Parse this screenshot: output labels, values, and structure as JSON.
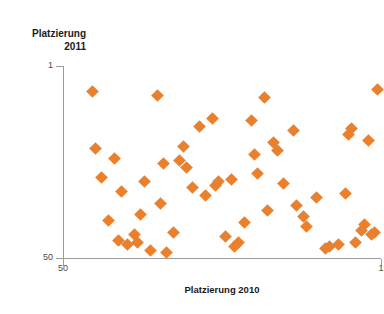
{
  "chart_data": {
    "type": "scatter",
    "title": "",
    "xlabel": "Platzierung 2010",
    "ylabel": "Platzierung 2011",
    "ylabel_lines": [
      "Platzierung",
      "2011"
    ],
    "xlim": [
      50,
      1
    ],
    "ylim": [
      1,
      50
    ],
    "x_reversed": true,
    "y_reversed": true,
    "grid": false,
    "legend": null,
    "marker": "diamond",
    "marker_color": "#E8802E",
    "xticks": [
      50,
      1
    ],
    "xtick_labels": [
      "50",
      "1"
    ],
    "yticks": [
      1,
      50
    ],
    "ytick_labels": [
      "1",
      "50"
    ],
    "series": [
      {
        "name": "Platzierung 2010 vs 2011",
        "color": "#E8802E",
        "points": [
          {
            "x": 45.5,
            "y": 7.5
          },
          {
            "x": 45.0,
            "y": 22.0
          },
          {
            "x": 44.0,
            "y": 29.5
          },
          {
            "x": 43.0,
            "y": 40.5
          },
          {
            "x": 42.0,
            "y": 24.5
          },
          {
            "x": 41.5,
            "y": 45.5
          },
          {
            "x": 41.0,
            "y": 33.0
          },
          {
            "x": 40.0,
            "y": 46.5
          },
          {
            "x": 39.0,
            "y": 44.0
          },
          {
            "x": 38.5,
            "y": 46.0
          },
          {
            "x": 38.0,
            "y": 39.0
          },
          {
            "x": 37.5,
            "y": 30.5
          },
          {
            "x": 36.5,
            "y": 48.0
          },
          {
            "x": 35.5,
            "y": 8.5
          },
          {
            "x": 35.0,
            "y": 36.0
          },
          {
            "x": 34.5,
            "y": 26.0
          },
          {
            "x": 34.0,
            "y": 48.5
          },
          {
            "x": 33.0,
            "y": 43.5
          },
          {
            "x": 32.0,
            "y": 25.0
          },
          {
            "x": 31.5,
            "y": 21.5
          },
          {
            "x": 31.0,
            "y": 27.0
          },
          {
            "x": 30.0,
            "y": 32.0
          },
          {
            "x": 29.0,
            "y": 16.5
          },
          {
            "x": 28.0,
            "y": 34.0
          },
          {
            "x": 27.0,
            "y": 14.5
          },
          {
            "x": 26.5,
            "y": 31.5
          },
          {
            "x": 26.0,
            "y": 30.5
          },
          {
            "x": 25.0,
            "y": 44.5
          },
          {
            "x": 24.0,
            "y": 30.0
          },
          {
            "x": 23.5,
            "y": 47.0
          },
          {
            "x": 23.0,
            "y": 46.0
          },
          {
            "x": 22.0,
            "y": 41.0
          },
          {
            "x": 21.0,
            "y": 15.0
          },
          {
            "x": 20.5,
            "y": 23.5
          },
          {
            "x": 20.0,
            "y": 28.5
          },
          {
            "x": 19.0,
            "y": 9.0
          },
          {
            "x": 18.5,
            "y": 38.0
          },
          {
            "x": 17.5,
            "y": 20.5
          },
          {
            "x": 17.0,
            "y": 22.5
          },
          {
            "x": 16.0,
            "y": 31.0
          },
          {
            "x": 14.5,
            "y": 17.5
          },
          {
            "x": 14.0,
            "y": 36.5
          },
          {
            "x": 13.0,
            "y": 39.5
          },
          {
            "x": 12.5,
            "y": 42.0
          },
          {
            "x": 11.0,
            "y": 34.5
          },
          {
            "x": 9.5,
            "y": 47.5
          },
          {
            "x": 9.0,
            "y": 47.0
          },
          {
            "x": 7.5,
            "y": 46.5
          },
          {
            "x": 6.5,
            "y": 33.5
          },
          {
            "x": 6.0,
            "y": 18.5
          },
          {
            "x": 5.5,
            "y": 17.0
          },
          {
            "x": 5.0,
            "y": 46.0
          },
          {
            "x": 4.0,
            "y": 43.0
          },
          {
            "x": 3.5,
            "y": 41.5
          },
          {
            "x": 3.0,
            "y": 20.0
          },
          {
            "x": 2.5,
            "y": 44.0
          },
          {
            "x": 2.0,
            "y": 43.5
          },
          {
            "x": 1.5,
            "y": 7.0
          }
        ]
      }
    ]
  }
}
